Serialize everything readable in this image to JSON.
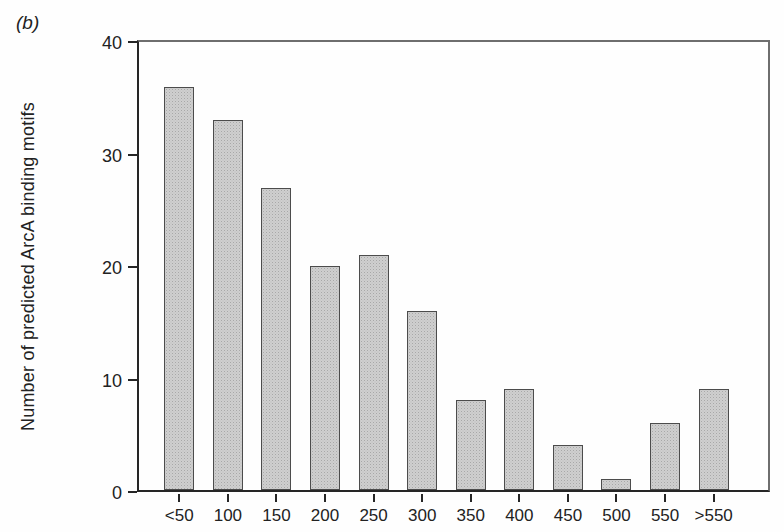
{
  "figure_label": "(b)",
  "chart_data": {
    "type": "bar",
    "categories": [
      "<50",
      "100",
      "150",
      "200",
      "250",
      "300",
      "350",
      "400",
      "450",
      "500",
      "550",
      ">550"
    ],
    "values": [
      36,
      33,
      27,
      20,
      21,
      16,
      8,
      9,
      4,
      1,
      6,
      9
    ],
    "title": "",
    "xlabel": "",
    "ylabel": "Number of predicted ArcA binding motifs",
    "ylim": [
      0,
      40
    ],
    "yticks": [
      0,
      10,
      20,
      30,
      40
    ],
    "grid": false,
    "legend": "none",
    "bar_fill_color": "#cfcfcf",
    "bar_border_color": "#4c4c4c",
    "axis_color": "#262626",
    "frame_color": "#6e6e6e"
  }
}
